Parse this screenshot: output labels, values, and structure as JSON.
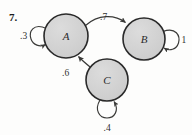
{
  "figure": {
    "problem_number": "7.",
    "type": "state-transition-diagram",
    "background_color": "#fdfdfc",
    "node_fill_color": "#d2d2d2",
    "node_stroke_color": "#2a2a2a",
    "edge_color": "#3a3a38"
  },
  "nodes": [
    {
      "id": "A",
      "label": "A",
      "cx": 66,
      "cy": 36,
      "r": 22
    },
    {
      "id": "B",
      "label": "B",
      "cx": 144,
      "cy": 39,
      "r": 21
    },
    {
      "id": "C",
      "label": "C",
      "cx": 107,
      "cy": 80,
      "r": 21
    }
  ],
  "edges": [
    {
      "from": "A",
      "to": "B",
      "label": ".7",
      "label_x": 104,
      "label_y": 20
    },
    {
      "from": "C",
      "to": "A",
      "label": ".6",
      "label_x": 67,
      "label_y": 73
    },
    {
      "from": "A",
      "to": "A",
      "label": ".3",
      "label_x": 24,
      "label_y": 36,
      "type": "self-loop"
    },
    {
      "from": "B",
      "to": "B",
      "label": "1",
      "label_x": 184,
      "label_y": 40,
      "type": "self-loop"
    },
    {
      "from": "C",
      "to": "C",
      "label": ".4",
      "label_x": 108,
      "label_y": 128,
      "type": "self-loop"
    }
  ]
}
